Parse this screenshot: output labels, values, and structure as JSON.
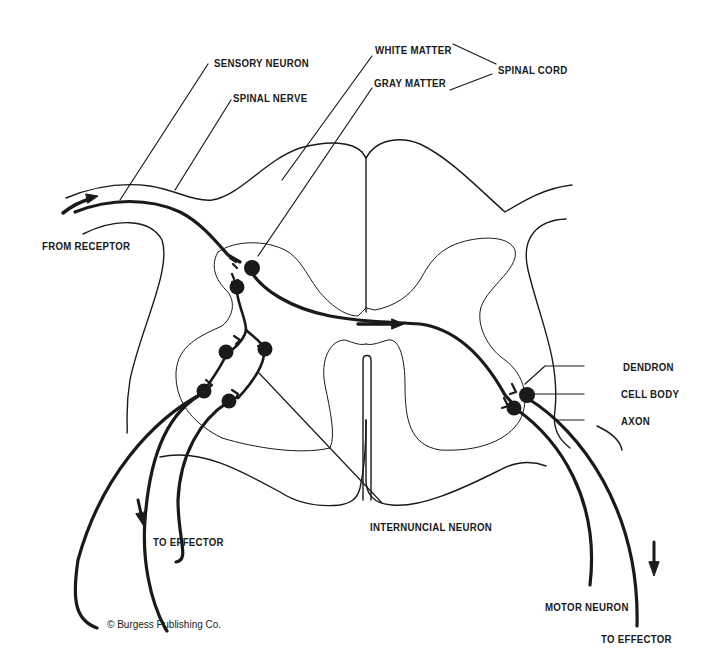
{
  "diagram": {
    "labels": {
      "sensory_neuron": "SENSORY NEURON",
      "spinal_nerve": "SPINAL NERVE",
      "white_matter": "WHITE MATTER",
      "gray_matter": "GRAY MATTER",
      "spinal_cord": "SPINAL CORD",
      "from_receptor": "FROM RECEPTOR",
      "dendron": "DENDRON",
      "cell_body": "CELL BODY",
      "axon": "AXON",
      "internuncial_neuron": "INTERNUNCIAL NEURON",
      "to_effector_left": "TO EFFECTOR",
      "motor_neuron": "MOTOR NEURON",
      "to_effector_right": "TO EFFECTOR"
    },
    "credit": "© Burgess Publishing Co.",
    "colors": {
      "ink": "#1a1a1a",
      "background": "#ffffff"
    },
    "arrows": [
      {
        "name": "from-receptor-arrow",
        "direction": "right"
      },
      {
        "name": "crossing-arrow",
        "direction": "right"
      },
      {
        "name": "to-effector-left-arrow",
        "direction": "down"
      },
      {
        "name": "to-effector-right-arrow",
        "direction": "down"
      }
    ]
  }
}
